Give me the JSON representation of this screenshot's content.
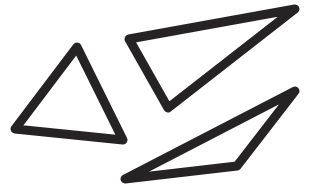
{
  "canvas": {
    "width": 310,
    "height": 196,
    "background": "#ffffff"
  },
  "style": {
    "stroke": "#262324",
    "stroke_width": 9
  },
  "shapes": [
    {
      "name": "triangle-left",
      "points": "77,47 15,129 123,140"
    },
    {
      "name": "triangle-upper-right",
      "points": "295,9 129,39 168,108"
    },
    {
      "name": "triangle-lower-right",
      "points": "295,91 125,179 237,166"
    }
  ]
}
